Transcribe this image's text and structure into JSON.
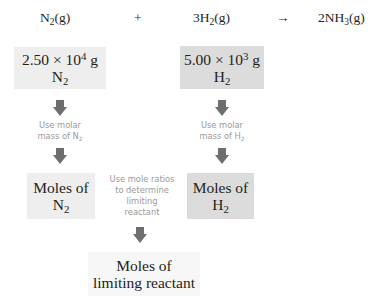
{
  "equation": {
    "reactant1": {
      "formula": "N",
      "sub": "2",
      "state": "(g)"
    },
    "plus": "+",
    "reactant2": {
      "coef": "3H",
      "sub": "2",
      "state": "(g)"
    },
    "arrow": "→",
    "product": {
      "coef": "2NH",
      "sub": "3",
      "state": "(g)"
    }
  },
  "boxes": {
    "mass_n2": {
      "line1_pre": "2.50 × 10",
      "exp": "4",
      "line1_post": " g",
      "line2": "N",
      "line2_sub": "2"
    },
    "mass_h2": {
      "line1_pre": "5.00 × 10",
      "exp": "3",
      "line1_post": " g",
      "line2": "H",
      "line2_sub": "2"
    },
    "moles_n2": {
      "line1": "Moles of",
      "line2": "N",
      "line2_sub": "2"
    },
    "moles_h2": {
      "line1": "Moles of",
      "line2": "H",
      "line2_sub": "2"
    },
    "moles_limiting": {
      "line1": "Moles of",
      "line2": "limiting reactant"
    }
  },
  "notes": {
    "molar_n2": {
      "line1": "Use molar",
      "line2": "mass of N",
      "sub": "2"
    },
    "molar_h2": {
      "line1": "Use molar",
      "line2": "mass of H",
      "sub": "2"
    },
    "mole_ratios": {
      "line1": "Use mole ratios",
      "line2": "to determine",
      "line3": "limiting",
      "line4": "reactant"
    }
  },
  "colors": {
    "arrow": "#6d6e70",
    "box_light": "#eeeeee",
    "box_dark": "#dcdcdc",
    "note_text": "#9a9a9a"
  }
}
